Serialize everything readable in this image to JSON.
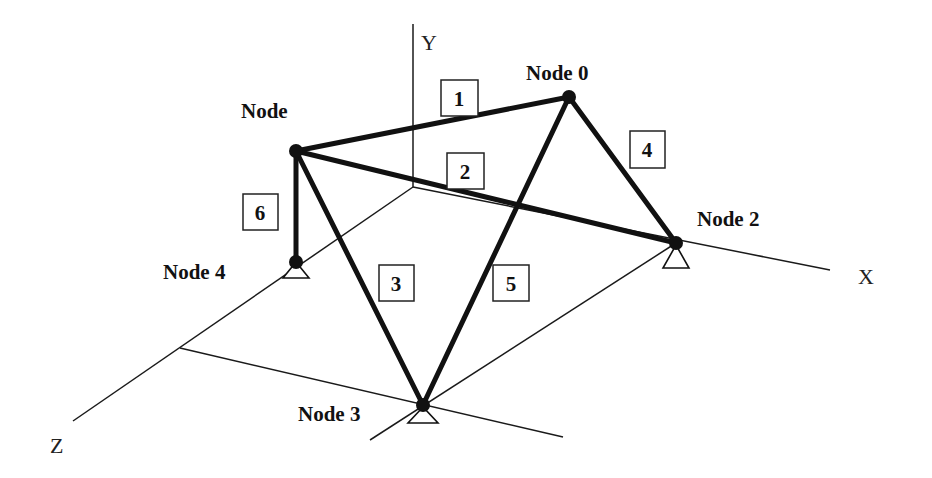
{
  "diagram": {
    "type": "3D truss structure",
    "axes": {
      "x_label": "X",
      "y_label": "Y",
      "z_label": "Z"
    },
    "nodes": [
      {
        "id": 0,
        "label": "Node 0",
        "support": false
      },
      {
        "id": 1,
        "label": "Node",
        "support": false
      },
      {
        "id": 2,
        "label": "Node 2",
        "support": true
      },
      {
        "id": 3,
        "label": "Node 3",
        "support": true
      },
      {
        "id": 4,
        "label": "Node 4",
        "support": true
      }
    ],
    "members": [
      {
        "label": "1",
        "from": "Node",
        "to": "Node 0"
      },
      {
        "label": "2",
        "from": "Node",
        "to": "Node 2"
      },
      {
        "label": "3",
        "from": "Node",
        "to": "Node 3"
      },
      {
        "label": "4",
        "from": "Node 0",
        "to": "Node 2"
      },
      {
        "label": "5",
        "from": "Node 0",
        "to": "Node 3"
      },
      {
        "label": "6",
        "from": "Node",
        "to": "Node 4"
      }
    ]
  }
}
